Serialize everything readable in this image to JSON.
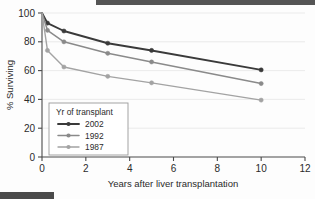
{
  "chart_data": {
    "type": "line",
    "title": "",
    "xlabel": "Years after liver transplantation",
    "ylabel": "% Surviving",
    "xlim": [
      0,
      12
    ],
    "ylim": [
      0,
      100
    ],
    "xticks": [
      0,
      2,
      4,
      6,
      8,
      10,
      12
    ],
    "yticks": [
      0,
      20,
      40,
      60,
      80,
      100
    ],
    "xtick_labels": [
      "0",
      "2",
      "4",
      "6",
      "8",
      "10",
      "12"
    ],
    "ytick_labels": [
      "0",
      "20",
      "40",
      "60",
      "80",
      "100"
    ],
    "grid": true,
    "grid_axis": "y",
    "legend_position": "lower-left-inside",
    "legend_title": "Yr of transplant",
    "marker": "circle",
    "series": [
      {
        "name": "2002",
        "color": "#3a3a3a",
        "x": [
          0,
          0.25,
          1,
          3,
          5,
          10
        ],
        "values": [
          100,
          93,
          87.5,
          79,
          74,
          60.5
        ],
        "markers_x": [
          0.25,
          1,
          3,
          5,
          10
        ],
        "markers_y": [
          93,
          87.5,
          79,
          74,
          60.5
        ]
      },
      {
        "name": "1992",
        "color": "#8a8a8a",
        "x": [
          0,
          0.25,
          1,
          3,
          5,
          10
        ],
        "values": [
          100,
          88,
          80,
          72,
          66,
          51
        ],
        "markers_x": [
          0.25,
          1,
          3,
          5,
          10
        ],
        "markers_y": [
          88,
          80,
          72,
          66,
          51
        ]
      },
      {
        "name": "1987",
        "color": "#a3a3a3",
        "x": [
          0,
          0.25,
          1,
          3,
          5,
          10
        ],
        "values": [
          100,
          74,
          62.5,
          56,
          51.5,
          39.5
        ],
        "markers_x": [
          0.25,
          1,
          3,
          5,
          10
        ],
        "markers_y": [
          74,
          62.5,
          56,
          51.5,
          39.5
        ]
      }
    ]
  },
  "axes": {
    "y_label": "% Surviving",
    "x_label": "Years after liver transplantation"
  },
  "legend": {
    "title": "Yr of transplant",
    "items": [
      {
        "label": "2002",
        "color": "#3a3a3a"
      },
      {
        "label": "1992",
        "color": "#8a8a8a"
      },
      {
        "label": "1987",
        "color": "#a3a3a3"
      }
    ]
  },
  "colors": {
    "axis": "#4a4a4a",
    "grid": "#e9e9e9",
    "background": "#fdfdfd",
    "text": "#2b2b2b"
  }
}
